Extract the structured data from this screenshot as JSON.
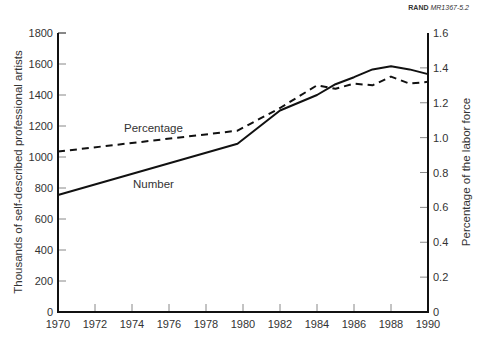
{
  "credit": {
    "org": "RAND",
    "id": "MR1367-5.2"
  },
  "chart_data": {
    "type": "line",
    "title": "",
    "xlabel": "",
    "ylabel": "Thousands of self-described professional artists",
    "y2label": "Percentage of the labor force",
    "xlim": [
      1970,
      1990
    ],
    "ylim": [
      0,
      1800
    ],
    "y2lim": [
      0,
      1.6
    ],
    "x_ticks": [
      "1970",
      "1972",
      "1974",
      "1976",
      "1978",
      "1980",
      "1982",
      "1984",
      "1986",
      "1988",
      "1990"
    ],
    "y_ticks": [
      "0",
      "200",
      "400",
      "600",
      "800",
      "1000",
      "1200",
      "1400",
      "1600",
      "1800"
    ],
    "y2_ticks": [
      "0",
      "0.2",
      "0.4",
      "0.6",
      "0.8",
      "1.0",
      "1.2",
      "1.4",
      "1.6"
    ],
    "grid": false,
    "legend": "inline labels",
    "series": [
      {
        "name": "Number",
        "axis": "left",
        "style": "solid",
        "x": [
          1970,
          1979.7,
          1982,
          1984,
          1985,
          1986,
          1987,
          1988,
          1989,
          1990
        ],
        "values": [
          755,
          1085,
          1300,
          1400,
          1470,
          1515,
          1565,
          1585,
          1565,
          1535
        ]
      },
      {
        "name": "Percentage",
        "axis": "right",
        "style": "dashed",
        "x": [
          1970,
          1979.7,
          1982,
          1984,
          1985,
          1986,
          1987,
          1988,
          1989,
          1990
        ],
        "values": [
          0.92,
          1.04,
          1.17,
          1.3,
          1.28,
          1.31,
          1.3,
          1.35,
          1.31,
          1.32
        ]
      }
    ]
  }
}
